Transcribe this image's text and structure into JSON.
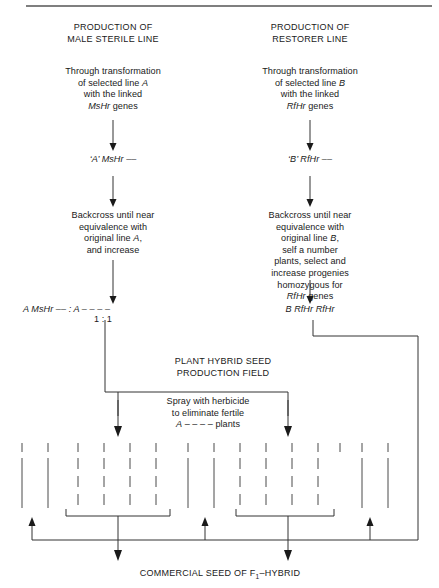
{
  "diagram": {
    "title_left": "PRODUCTION OF\nMALE STERILE LINE",
    "title_right": "PRODUCTION OF\nRESTORER LINE",
    "left": {
      "heading_line1": "PRODUCTION OF",
      "heading_line2": "MALE STERILE LINE",
      "step1": "Through transformation\nof selected line A\nwith the linked\nMsHr genes",
      "step1_l1": "Through transformation",
      "step1_l2_a": "of selected line ",
      "step1_l2_b": "A",
      "step1_l3": "with the linked",
      "step1_l4_a": "MsHr",
      "step1_l4_b": " genes",
      "genotype1_a": "‘A’ ",
      "genotype1_b": "MsHr",
      "genotype1_c": " ––",
      "step2_l1": "Backcross until near",
      "step2_l2": "equivalence with",
      "step2_l3_a": "original line ",
      "step2_l3_b": "A",
      "step2_l3_c": ",",
      "step2_l4": "and increase",
      "genotype2_a": "A MsHr",
      "genotype2_b": " –– : ",
      "genotype2_c": "A",
      "genotype2_d": " – – – –",
      "ratio": "1 : 1"
    },
    "right": {
      "heading_line1": "PRODUCTION OF",
      "heading_line2": "RESTORER LINE",
      "step1_l1": "Through transformation",
      "step1_l2_a": "of selected line ",
      "step1_l2_b": "B",
      "step1_l3": "with the linked",
      "step1_l4_a": "RfHr",
      "step1_l4_b": " genes",
      "genotype1_a": "‘B’ ",
      "genotype1_b": "RfHr",
      "genotype1_c": " ––",
      "step2_l1": "Backcross until near",
      "step2_l2": "equivalence with",
      "step2_l3_a": "original line ",
      "step2_l3_b": "B",
      "step2_l3_c": ",",
      "step2_l4": "self a number",
      "step2_l5": "plants, select and",
      "step2_l6": "increase progenies",
      "step2_l7": "homozygous for",
      "step2_l8_a": "RfHr",
      "step2_l8_b": " genes",
      "genotype2_a": "B RfHr RfHr"
    },
    "field": {
      "label_l1": "PLANT HYBRID SEED",
      "label_l2": "PRODUCTION FIELD",
      "spray_l1": "Spray with herbicide",
      "spray_l2": "to eliminate fertile",
      "spray_l3_a": "A",
      "spray_l3_b": " – – – – plants"
    },
    "footer": {
      "text_a": "COMMERCIAL SEED OF F",
      "text_sub": "1",
      "text_b": "–HYBRID"
    },
    "colors": {
      "ink": "#1a1a1a",
      "line": "#333333",
      "rule": "#555555",
      "plant": "#4a4a4a",
      "background": "#ffffff"
    },
    "plot_rows": {
      "solid_columns_x": [
        22,
        48,
        188,
        214,
        362,
        388
      ],
      "dashed_columns_x": [
        78,
        104,
        130,
        156,
        240,
        266,
        292,
        318
      ],
      "tick_count": 16
    }
  }
}
